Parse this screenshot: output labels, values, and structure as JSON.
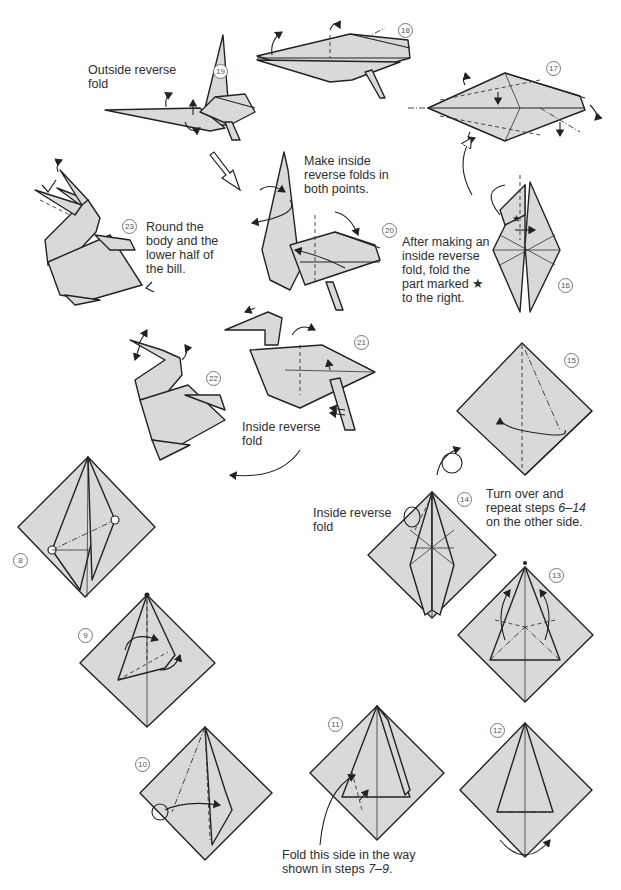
{
  "diagram": {
    "paper_fill": "#d9d9d9",
    "line_color": "#222222",
    "background": "#ffffff"
  },
  "steps": [
    {
      "number": "⑧",
      "n": 8
    },
    {
      "number": "⑨",
      "n": 9
    },
    {
      "number": "⑩",
      "n": 10
    },
    {
      "number": "⑪",
      "n": 11,
      "caption": "Fold this side in the way shown in steps 7–9."
    },
    {
      "number": "⑫",
      "n": 12
    },
    {
      "number": "⑬",
      "n": 13
    },
    {
      "number": "⑭",
      "n": 14,
      "caption": "Inside reverse fold"
    },
    {
      "number": "⑮",
      "n": 15
    },
    {
      "number": "⑯",
      "n": 16,
      "caption": "After making an inside reverse fold, fold the part marked ★ to the right."
    },
    {
      "number": "⑰",
      "n": 17
    },
    {
      "number": "⑱",
      "n": 18
    },
    {
      "number": "⑲",
      "n": 19,
      "caption": "Outside reverse fold"
    },
    {
      "number": "⑳",
      "n": 20,
      "caption": "Make inside reverse folds in both points."
    },
    {
      "number": "㉑",
      "n": 21
    },
    {
      "number": "㉒",
      "n": 22,
      "caption": "Inside reverse fold"
    },
    {
      "number": "㉓",
      "n": 23,
      "caption": "Round the body and the lower half of the bill."
    }
  ],
  "labels": {
    "outside_reverse": "Outside reverse\nfold",
    "make_inside": "Make inside\nreverse folds in\nboth points.",
    "round_body": "Round the\nbody and the\nlower half of\nthe bill.",
    "after_making": "After making an\ninside reverse\nfold, fold the\npart marked ★\nto the right.",
    "inside_reverse_22": "Inside reverse\nfold",
    "inside_reverse_14": "Inside reverse\nfold",
    "turn_over_pre": "Turn over and\nrepeat steps ",
    "turn_over_range": "6–14",
    "turn_over_post": "\non the other side.",
    "fold_this_pre": "Fold this side in the way\nshown in steps ",
    "fold_this_range": "7–9",
    "fold_this_post": "."
  },
  "icons": {
    "star": "★",
    "turn_over_symbol": "turn-over-icon"
  }
}
